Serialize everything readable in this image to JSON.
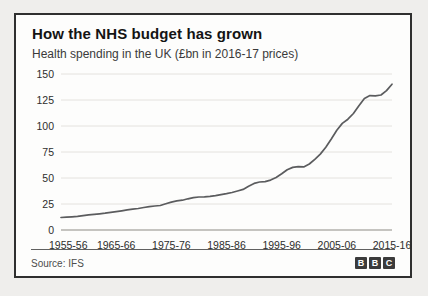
{
  "header": {
    "title": "How the NHS budget has grown",
    "subtitle": "Health spending in the UK (£bn in 2016-17 prices)"
  },
  "chart_data": {
    "type": "line",
    "title": "How the NHS budget has grown",
    "subtitle": "Health spending in the UK (£bn in 2016-17 prices)",
    "xlabel": "",
    "ylabel": "",
    "unit": "£bn in 2016-17 prices",
    "grid": "horizontal",
    "legend": "none",
    "ylim": [
      0,
      150
    ],
    "y_ticks": [
      0,
      25,
      50,
      75,
      100,
      125,
      150
    ],
    "x_tick_labels": [
      "1955-56",
      "1965-66",
      "1975-76",
      "1985-86",
      "1995-96",
      "2005-06",
      "2015-16"
    ],
    "line_color": "#5b5c5e",
    "gridline_color": "#e4e2de",
    "axis_line_color": "#b2b0ac",
    "series": [
      {
        "name": "UK health spending",
        "start_year_label": "1955-56",
        "end_year_label": "2015-16",
        "values": [
          12.0,
          12.3,
          12.7,
          13.2,
          13.8,
          14.5,
          15.1,
          15.6,
          16.2,
          17.0,
          17.7,
          18.5,
          19.3,
          20.0,
          20.7,
          21.6,
          22.5,
          23.1,
          23.6,
          25.3,
          26.8,
          28.0,
          28.7,
          30.0,
          31.2,
          31.7,
          31.9,
          32.3,
          33.0,
          33.9,
          34.9,
          36.1,
          37.5,
          39.0,
          42.0,
          44.8,
          46.2,
          46.5,
          48.0,
          50.5,
          54.0,
          58.0,
          60.2,
          61.0,
          60.7,
          63.5,
          68.0,
          73.0,
          79.5,
          87.5,
          96.0,
          102.5,
          106.5,
          112.0,
          119.5,
          126.5,
          129.2,
          129.0,
          129.8,
          134.0,
          140.2
        ]
      }
    ]
  },
  "footer": {
    "source": "Source: IFS",
    "logo": {
      "name": "BBC",
      "letters": [
        "B",
        "B",
        "C"
      ],
      "block_color": "#3b3b3b",
      "letter_color": "#ffffff"
    }
  }
}
